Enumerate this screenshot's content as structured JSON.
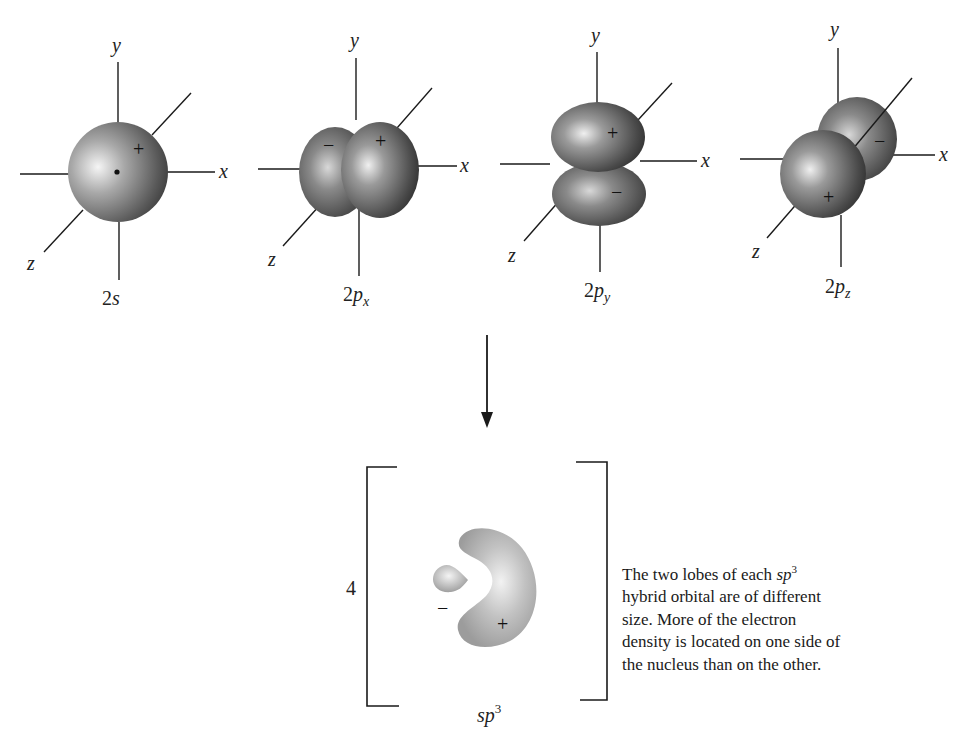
{
  "orbitals": [
    {
      "id": "2s",
      "label_main": "2",
      "label_letter": "s",
      "label_sub": "",
      "signs": [
        "+"
      ],
      "axes": {
        "x": "x",
        "y": "y",
        "z": "z"
      }
    },
    {
      "id": "2px",
      "label_main": "2",
      "label_letter": "p",
      "label_sub": "x",
      "signs": [
        "−",
        "+"
      ],
      "axes": {
        "x": "x",
        "y": "y",
        "z": "z"
      }
    },
    {
      "id": "2py",
      "label_main": "2",
      "label_letter": "p",
      "label_sub": "y",
      "signs": [
        "+",
        "−"
      ],
      "axes": {
        "x": "x",
        "y": "y",
        "z": "z"
      }
    },
    {
      "id": "2pz",
      "label_main": "2",
      "label_letter": "p",
      "label_sub": "z",
      "signs": [
        "−",
        "+"
      ],
      "axes": {
        "x": "x",
        "y": "y",
        "z": "z"
      }
    }
  ],
  "hybrid": {
    "multiplier": "4",
    "label_base": "sp",
    "label_sup": "3",
    "small_lobe_sign": "−",
    "large_lobe_sign": "+"
  },
  "caption": {
    "part1": "The two lobes of each ",
    "term_base": "sp",
    "term_sup": "3",
    "part2": " hybrid orbital are of different size. More of the electron density is located on one side of the nucleus than on the other."
  },
  "colors": {
    "orbital_dark": "#3a3a3a",
    "orbital_light": "#e8e8e8",
    "hybrid_fill": "#a9a9a9",
    "hybrid_highlight": "#eeeeee",
    "line": "#1a1a1a"
  }
}
